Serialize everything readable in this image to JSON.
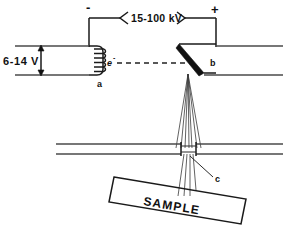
{
  "figure": {
    "background_color": "#ffffff",
    "line_color": "#1a1a1a"
  },
  "labels": {
    "filament_voltage": "6-14 V",
    "accelerating_voltage": "15-100 kV",
    "cathode_sign": "-",
    "anode_sign": "+",
    "electron_symbol": "e",
    "electron_charge": "-",
    "cathode_node": "a",
    "anode_node": "b",
    "window_node": "c",
    "sample": "SAMPLE"
  },
  "components": {
    "filament_label": "filament-coil",
    "cathode_label": "cathode-assembly",
    "anode_label": "anode-target",
    "beam_label": "x-ray-beam-fan",
    "window_label": "beryllium-window",
    "sample_label": "sample-holder",
    "electron_beam_label": "electron-beam-path"
  },
  "geometry": {
    "tube_top_wall_y": 46,
    "tube_bottom_wall_y": 75,
    "housing_wall_y": 148,
    "anode_apex_x": 188,
    "anode_apex_y": 74,
    "window_x": 188,
    "window_y": 150
  }
}
